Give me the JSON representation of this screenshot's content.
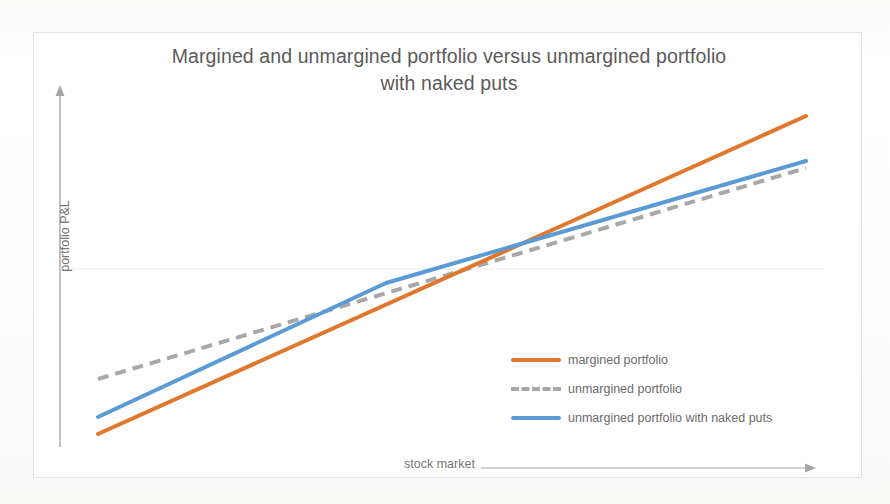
{
  "chart_data": {
    "type": "line",
    "title": "Margined and unmargined portfolio versus unmargined portfolio with naked puts",
    "title_line1": "Margined and unmargined portfolio versus unmargined portfolio",
    "title_line2": "with naked puts",
    "xlabel": "stock market",
    "ylabel": "portfolio P&L",
    "grid": false,
    "zero_line": true,
    "axis_ticks": [],
    "xlim": [
      0,
      100
    ],
    "ylim": [
      -100,
      100
    ],
    "legend_position": "inside-lower-right",
    "series": [
      {
        "name": "margined portfolio",
        "label": "margined portfolio",
        "color": "#e0772c",
        "style": "solid",
        "width": 4,
        "x": [
          0,
          100
        ],
        "y": [
          -85,
          88
        ],
        "points_px": [
          [
            97,
            433
          ],
          [
            805,
            115
          ]
        ]
      },
      {
        "name": "unmargined portfolio",
        "label": "unmargined portfolio",
        "color": "#a8a8a8",
        "style": "dashed",
        "width": 4,
        "x": [
          0,
          100
        ],
        "y": [
          -37,
          52
        ],
        "points_px": [
          [
            97,
            378
          ],
          [
            805,
            167
          ]
        ]
      },
      {
        "name": "unmargined portfolio with naked puts",
        "label": "unmargined portfolio with naked puts",
        "color": "#5b9bd5",
        "style": "solid",
        "width": 4,
        "x": [
          0,
          41,
          100
        ],
        "y": [
          -72,
          0,
          56
        ],
        "points_px": [
          [
            97,
            416
          ],
          [
            385,
            282
          ],
          [
            805,
            160
          ]
        ],
        "note": "kinked line: steeper slope left of the strike, flattens to match unmargined slope to the right"
      }
    ],
    "annotations": []
  },
  "axes": {
    "y_arrow": {
      "name": "y-axis-arrow",
      "direction": "up"
    },
    "x_arrow": {
      "name": "x-axis-arrow",
      "direction": "right"
    }
  },
  "colors": {
    "orange": "#e0772c",
    "blue": "#5b9bd5",
    "gray": "#a8a8a8",
    "title_text": "#5a5a5a",
    "label_text": "#767676",
    "frame": "#e2e2e2",
    "zero_line": "#e9e9e9",
    "axis_line": "#a6a6a6"
  }
}
